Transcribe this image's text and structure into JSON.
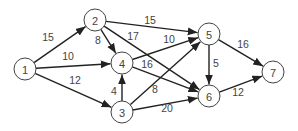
{
  "diagram": {
    "type": "directed weighted graph",
    "nodes": [
      {
        "id": "1",
        "label": "1",
        "x": 25,
        "y": 69
      },
      {
        "id": "2",
        "label": "2",
        "x": 95,
        "y": 20
      },
      {
        "id": "3",
        "label": "3",
        "x": 122,
        "y": 112
      },
      {
        "id": "4",
        "label": "4",
        "x": 122,
        "y": 63
      },
      {
        "id": "5",
        "label": "5",
        "x": 209,
        "y": 34
      },
      {
        "id": "6",
        "label": "6",
        "x": 209,
        "y": 96
      },
      {
        "id": "7",
        "label": "7",
        "x": 273,
        "y": 72
      }
    ],
    "edges": [
      {
        "from": "1",
        "to": "2",
        "weight": "15",
        "lx": 48,
        "ly": 37
      },
      {
        "from": "1",
        "to": "4",
        "weight": "10",
        "lx": 68,
        "ly": 56
      },
      {
        "from": "1",
        "to": "3",
        "weight": "12",
        "lx": 75,
        "ly": 80
      },
      {
        "from": "2",
        "to": "4",
        "weight": "8",
        "lx": 98,
        "ly": 40
      },
      {
        "from": "2",
        "to": "5",
        "weight": "15",
        "lx": 150,
        "ly": 20
      },
      {
        "from": "2",
        "to": "6",
        "weight": "17",
        "lx": 133,
        "ly": 36
      },
      {
        "from": "3",
        "to": "4",
        "weight": "4",
        "lx": 114,
        "ly": 91
      },
      {
        "from": "3",
        "to": "5",
        "weight": "8",
        "lx": 155,
        "ly": 89
      },
      {
        "from": "3",
        "to": "6",
        "weight": "20",
        "lx": 167,
        "ly": 108
      },
      {
        "from": "4",
        "to": "5",
        "weight": "10",
        "lx": 169,
        "ly": 39
      },
      {
        "from": "4",
        "to": "6",
        "weight": "16",
        "lx": 147,
        "ly": 64
      },
      {
        "from": "5",
        "to": "6",
        "weight": "5",
        "lx": 216,
        "ly": 63
      },
      {
        "from": "5",
        "to": "7",
        "weight": "16",
        "lx": 243,
        "ly": 44
      },
      {
        "from": "6",
        "to": "7",
        "weight": "12",
        "lx": 238,
        "ly": 92
      }
    ]
  }
}
